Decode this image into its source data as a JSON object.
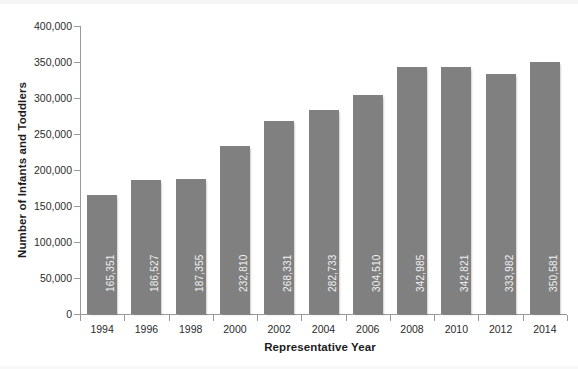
{
  "chart_data": {
    "type": "bar",
    "title": "",
    "subtitle": "",
    "xlabel": "Representative Year",
    "ylabel": "Number of Infants and Toddlers",
    "categories": [
      "1994",
      "1996",
      "1998",
      "2000",
      "2002",
      "2004",
      "2006",
      "2008",
      "2010",
      "2012",
      "2014"
    ],
    "values": [
      165351,
      186527,
      187355,
      232810,
      268331,
      282733,
      304510,
      342985,
      342821,
      333982,
      350581
    ],
    "value_labels": [
      "165,351",
      "186,527",
      "187,355",
      "232,810",
      "268,331",
      "282,733",
      "304,510",
      "342,985",
      "342,821",
      "333,982",
      "350,581"
    ],
    "ylim": [
      0,
      400000
    ],
    "y_ticks": [
      0,
      50000,
      100000,
      150000,
      200000,
      250000,
      300000,
      350000,
      400000
    ],
    "y_tick_labels": [
      "0",
      "50,000",
      "100,000",
      "150,000",
      "200,000",
      "250,000",
      "300,000",
      "350,000",
      "400,000"
    ],
    "grid": false,
    "legend": false,
    "legend_position": "none",
    "bar_color": "#808080",
    "value_label_color": "#f0f0f0",
    "axis_color": "#9a9a9a",
    "text_color": "#2b2b2b",
    "background": "#ffffff"
  }
}
